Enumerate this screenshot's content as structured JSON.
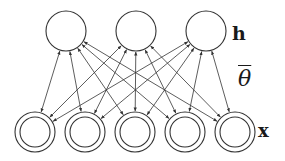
{
  "diagram": {
    "type": "bipartite-network",
    "layers": {
      "hidden": {
        "label": "h",
        "node_style": "single-circle",
        "nodes": [
          {
            "id": "h1",
            "cx": 66,
            "cy": 31,
            "r": 20
          },
          {
            "id": "h2",
            "cx": 136,
            "cy": 31,
            "r": 20
          },
          {
            "id": "h3",
            "cx": 206,
            "cy": 31,
            "r": 20
          }
        ]
      },
      "visible": {
        "label": "x",
        "node_style": "double-circle",
        "nodes": [
          {
            "id": "x1",
            "cx": 35,
            "cy": 132,
            "r": 20,
            "r_inner": 15
          },
          {
            "id": "x2",
            "cx": 85,
            "cy": 132,
            "r": 20,
            "r_inner": 15
          },
          {
            "id": "x3",
            "cx": 135,
            "cy": 132,
            "r": 20,
            "r_inner": 15
          },
          {
            "id": "x4",
            "cx": 185,
            "cy": 132,
            "r": 20,
            "r_inner": 15
          },
          {
            "id": "x5",
            "cx": 235,
            "cy": 132,
            "r": 20,
            "r_inner": 15
          }
        ]
      }
    },
    "edges": {
      "connectivity": "fully-connected between hidden and visible",
      "direction": "bidirectional",
      "count": 15
    },
    "parameter_label": "θ",
    "colors": {
      "stroke": "#333333",
      "text": "#1a1a1a",
      "background": "#ffffff"
    }
  }
}
